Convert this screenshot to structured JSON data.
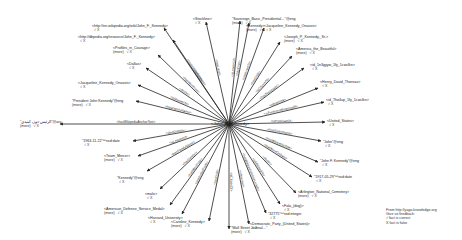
{
  "center": {
    "label": "<John_F._Kennedy>",
    "x": 229,
    "y": 124
  },
  "mark": "√ X",
  "more_label": "(more)",
  "edges": [
    {
      "relation": "<hasWikipediaUrl>",
      "target": "<http://en.wikipedia.org/wiki/John_F._Kennedy>",
      "tx": 164,
      "ty": 28,
      "lx": 92,
      "ly": 24,
      "more": false
    },
    {
      "relation": "<hasWebsite>",
      "target": "<http://dbpedia.org/resource/John_F._Kennedy>",
      "tx": 173,
      "ty": 40,
      "lx": 78,
      "ly": 35,
      "more": false
    },
    {
      "relation": "<hasWonPrize>",
      "target": "<Profiles_in_Courage>",
      "tx": 158,
      "ty": 55,
      "lx": 113,
      "ly": 46,
      "more": true
    },
    {
      "relation": "<diedIn>",
      "target": "<Dallas>",
      "tx": 146,
      "ty": 68,
      "lx": 127,
      "ly": 62,
      "more": false
    },
    {
      "relation": "<isMarriedTo>",
      "target": "<Jacqueline_Kennedy_Onassis>",
      "tx": 138,
      "ty": 85,
      "lx": 78,
      "ly": 81,
      "more": false
    },
    {
      "relation": "<hasFamilyName>",
      "target": "\"President John Kennedy\"@eng",
      "tx": 136,
      "ty": 101,
      "lx": 72,
      "ly": 99,
      "more": true
    },
    {
      "relation": "<hasWikipediaAnchorText>",
      "target": "\"الرئيس جون كينيدي\"@ara",
      "tx": 60,
      "ty": 124,
      "lx": 20,
      "ly": 120,
      "more": true
    },
    {
      "relation": "<diedOnDate>",
      "target": "\"1963-11-22\"^^xsd:date",
      "tx": 133,
      "ty": 141,
      "lx": 82,
      "ly": 139,
      "more": false
    },
    {
      "relation": "<isLeaderOf>",
      "target": "<Team_Mercer>",
      "tx": 138,
      "ty": 156,
      "lx": 104,
      "ly": 154,
      "more": true
    },
    {
      "relation": "<hasFamilyName>",
      "target": "\"Kennedy\"@eng",
      "tx": 147,
      "ty": 171,
      "lx": 117,
      "ly": 176,
      "more": false
    },
    {
      "relation": "<hasGender>",
      "target": "<male>",
      "tx": 160,
      "ty": 189,
      "lx": 145,
      "ly": 192,
      "more": false
    },
    {
      "relation": "<hasWonPrize>",
      "target": "<American_Defense_Service_Medal>",
      "tx": 170,
      "ty": 205,
      "lx": 104,
      "ly": 207,
      "more": true
    },
    {
      "relation": "<graduatedFrom>",
      "target": "<Harvard_University>",
      "tx": 182,
      "ty": 214,
      "lx": 148,
      "ly": 216,
      "more": false
    },
    {
      "relation": "<hasChild>",
      "target": "<Caroline_Kennedy>",
      "tx": 209,
      "ty": 221,
      "lx": 171,
      "ly": 220,
      "more": true
    },
    {
      "relation": "<isCitizenOf>",
      "target": "\"Wall Street Journal…\"",
      "tx": 229,
      "ty": 229,
      "lx": 231,
      "ly": 226,
      "more": true
    },
    {
      "relation": "<influences>",
      "target": "<Democratic_Party_(United_States)>",
      "tx": 249,
      "ty": 224,
      "lx": 250,
      "ly": 222,
      "more": false
    },
    {
      "relation": "<hasWikipediaArticleLength>",
      "target": "\"32775\"^^xsd:integer",
      "tx": 266,
      "ty": 213,
      "lx": 268,
      "ly": 212,
      "more": false
    },
    {
      "relation": "<isAffiliatedTo>",
      "target": "<Fala_(dog)>",
      "tx": 280,
      "ty": 204,
      "lx": 282,
      "ly": 204,
      "more": false
    },
    {
      "relation": "<diedIn>",
      "target": "<Arlington_National_Cemetery>",
      "tx": 296,
      "ty": 193,
      "lx": 298,
      "ly": 190,
      "more": true
    },
    {
      "relation": "<wasBornOnDate>",
      "target": "\"1917-05-29\"^^xsd:date",
      "tx": 312,
      "ty": 177,
      "lx": 314,
      "ly": 175,
      "more": false
    },
    {
      "relation": "<hasWikipediaTitle>",
      "target": "\"John F. Kennedy\"@eng",
      "tx": 318,
      "ty": 162,
      "lx": 320,
      "ly": 159,
      "more": false
    },
    {
      "relation": "<hasGivenName>",
      "target": "\"John\"@eng",
      "tx": 321,
      "ty": 141,
      "lx": 323,
      "ly": 140,
      "more": false
    },
    {
      "relation": "<isPoliticianOf>",
      "target": "<United_States>",
      "tx": 325,
      "ty": 122,
      "lx": 327,
      "ly": 119,
      "more": false
    },
    {
      "relation": "<isPreferredMeaningOf>",
      "target": "<id_Tho4up_1fy_1cwclkn>",
      "tx": 324,
      "ty": 102,
      "lx": 326,
      "ly": 98,
      "more": false
    },
    {
      "relation": "<influences>",
      "target": "<Henry_David_Thoreau>",
      "tx": 318,
      "ty": 88,
      "lx": 320,
      "ly": 80,
      "more": false
    },
    {
      "relation": "<hasSuccessor>",
      "target": "<id_1n3gyyw_1fy_1cwclkn>",
      "tx": 304,
      "ty": 68,
      "lx": 310,
      "ly": 63,
      "more": false
    },
    {
      "relation": "<isCitizenOf>",
      "target": "<America_the_Beautiful>",
      "tx": 292,
      "ty": 56,
      "lx": 296,
      "ly": 47,
      "more": true
    },
    {
      "relation": "<hasChild>",
      "target": "<Joseph_P._Kennedy,_Sr.>",
      "tx": 280,
      "ty": 42,
      "lx": 284,
      "ly": 35,
      "more": true
    },
    {
      "relation": "<isMarriedTo>",
      "target": "<Jacqueline_Kennedy_Onassis>",
      "tx": 264,
      "ty": 28,
      "lx": 264,
      "ly": 24,
      "more": false
    },
    {
      "relation": "<hasChild>",
      "target": "<Kennedy>",
      "tx": 249,
      "ty": 23,
      "lx": 246,
      "ly": 24,
      "more": true
    },
    {
      "relation": "<isLeaderOf>",
      "target": "\"Sovereign_Basic_Presidential…\"@eng",
      "tx": 240,
      "ty": 21,
      "lx": 232,
      "ly": 17,
      "more": true
    },
    {
      "relation": "<hasLabel>",
      "target": "<Stockline>",
      "tx": 206,
      "ty": 22,
      "lx": 193,
      "ly": 17,
      "more": false
    }
  ],
  "footer": {
    "source": "From http://yago-knowledge.org",
    "feedback": "Give us feedback:",
    "correct": "√ fact is correct",
    "false": "X fact is false"
  },
  "bottom_text": "Lyndon B. Johnson … of Cosmetics, by Ted Sorensen …"
}
